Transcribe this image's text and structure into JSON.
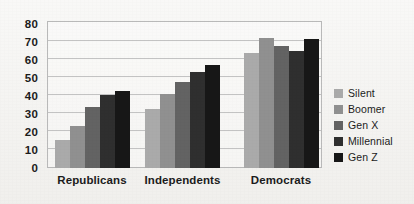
{
  "chart_data": {
    "type": "bar",
    "title": "",
    "subtitle": "",
    "xlabel": "",
    "ylabel": "",
    "categories": [
      "Republicans",
      "Independents",
      "Democrats"
    ],
    "series": [
      {
        "name": "Silent",
        "color": "#aaaaaa",
        "values": [
          15.5,
          33,
          64
        ]
      },
      {
        "name": "Boomer",
        "color": "#909090",
        "values": [
          23.5,
          41,
          72
        ]
      },
      {
        "name": "Gen X",
        "color": "#636363",
        "values": [
          34,
          48,
          68
        ]
      },
      {
        "name": "Millennial",
        "color": "#2f2f2f",
        "values": [
          40.5,
          53.5,
          65
        ]
      },
      {
        "name": "Gen Z",
        "color": "#171717",
        "values": [
          43,
          57,
          71.5
        ]
      }
    ],
    "ylim": [
      0,
      80
    ],
    "yticks": [
      0,
      10,
      20,
      30,
      40,
      50,
      60,
      70,
      80
    ],
    "ytick_labels": [
      "0",
      "10",
      "20",
      "30",
      "40",
      "50",
      "60",
      "70",
      "80"
    ],
    "grid": true,
    "grid_axis": "y",
    "legend_position": "right",
    "background_color": "#f1f0ed",
    "grid_color": "#c3c3c3",
    "axis_color": "#b9b9b9",
    "text_color": "#1c1c1c"
  }
}
